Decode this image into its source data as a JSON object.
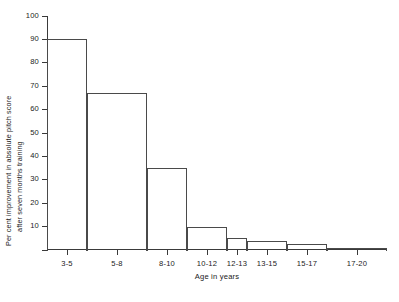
{
  "chart_data": {
    "type": "bar",
    "title": "",
    "xlabel": "Age in years",
    "ylabel": "Per cent improvement in absolute pitch score after seven months training",
    "ylabel_line1": "Per cent improvement in absolute pitch score",
    "ylabel_line2": "after seven months training",
    "categories": [
      "3-5",
      "5-8",
      "8-10",
      "10-12",
      "12-13",
      "13-15",
      "15-17",
      "17-20"
    ],
    "values": [
      90,
      67,
      35,
      10,
      5,
      4,
      2.5,
      1
    ],
    "bin_edges": [
      3,
      5,
      8,
      10,
      12,
      13,
      15,
      17,
      20
    ],
    "ylim": [
      0,
      100
    ],
    "yticks": [
      0,
      10,
      20,
      30,
      40,
      50,
      60,
      70,
      80,
      90,
      100
    ],
    "ytick_labels": [
      "",
      "10",
      "20",
      "30",
      "40",
      "50",
      "60",
      "70",
      "80",
      "90",
      "100"
    ],
    "grid": false,
    "legend": false,
    "legend_position": "none",
    "bar_style": "outline",
    "bar_color": "#ffffff",
    "bar_edge_color": "#4a4a4a",
    "axis_color": "#3a3a3a"
  }
}
